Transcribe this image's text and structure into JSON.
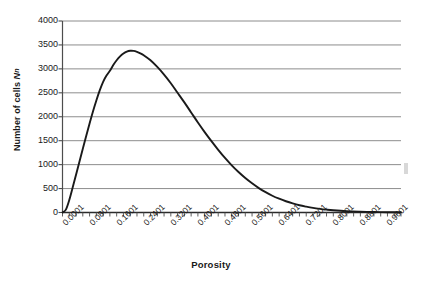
{
  "figure": {
    "background_color": "#ffffff",
    "curve_color": "#1a1a1a",
    "grid_color": "#808080",
    "axis_color": "#4d4d4d",
    "artifact_name": "scan-artifact"
  },
  "chart_data": {
    "type": "line",
    "title": "",
    "xlabel": "Porosity",
    "ylabel": "Number of cells N",
    "ylabel_subscript": "n",
    "xlim": [
      0.0001,
      1.0001
    ],
    "ylim": [
      0,
      4000
    ],
    "grid": "horizontal",
    "legend": "none",
    "ytick_labels": [
      "0",
      "500",
      "1000",
      "1500",
      "2000",
      "2500",
      "3000",
      "3500",
      "4000"
    ],
    "ytick_values": [
      0,
      500,
      1000,
      1500,
      2000,
      2500,
      3000,
      3500,
      4000
    ],
    "xtick_labels": [
      "0.0001",
      "0.0801",
      "0.1601",
      "0.2401",
      "0.3201",
      "0.4001",
      "0.4801",
      "0.5601",
      "0.6401",
      "0.7201",
      "0.8001",
      "0.8801",
      "0.9601"
    ],
    "xtick_values": [
      0.0001,
      0.0801,
      0.1601,
      0.2401,
      0.3201,
      0.4001,
      0.4801,
      0.5601,
      0.6401,
      0.7201,
      0.8001,
      0.8801,
      0.9601
    ],
    "minor_ticks_per_interval": 4,
    "series": [
      {
        "name": "Number of cells",
        "x": [
          0.0001,
          0.0101,
          0.0201,
          0.0301,
          0.0401,
          0.0501,
          0.0601,
          0.0701,
          0.0801,
          0.0901,
          0.1001,
          0.1101,
          0.1201,
          0.1301,
          0.1401,
          0.1501,
          0.1601,
          0.1701,
          0.1801,
          0.1901,
          0.2001,
          0.2101,
          0.2201,
          0.2301,
          0.2401,
          0.2601,
          0.2801,
          0.3001,
          0.3201,
          0.3401,
          0.3601,
          0.3801,
          0.4001,
          0.4201,
          0.4401,
          0.4601,
          0.4801,
          0.5001,
          0.5201,
          0.5401,
          0.5601,
          0.5801,
          0.6001,
          0.6201,
          0.6401,
          0.6601,
          0.6801,
          0.7001,
          0.7201,
          0.7401,
          0.7601,
          0.7801,
          0.8001,
          0.8401,
          0.8801,
          0.9201,
          0.9601,
          1.0001
        ],
        "y": [
          0,
          60,
          260,
          520,
          790,
          1060,
          1330,
          1600,
          1860,
          2110,
          2340,
          2550,
          2730,
          2860,
          2960,
          3080,
          3180,
          3260,
          3320,
          3360,
          3378,
          3375,
          3355,
          3325,
          3285,
          3180,
          3040,
          2880,
          2700,
          2500,
          2300,
          2090,
          1880,
          1680,
          1490,
          1310,
          1140,
          985,
          845,
          720,
          610,
          510,
          425,
          350,
          288,
          235,
          190,
          152,
          122,
          96,
          76,
          60,
          47,
          28,
          17,
          10,
          6,
          4
        ]
      }
    ],
    "peak": {
      "x": 0.2001,
      "y": 3378
    }
  },
  "axis_titles": {
    "x": "Porosity",
    "y_prefix": "Number of cells ",
    "y_symbol": "N",
    "y_subscript": "n"
  }
}
